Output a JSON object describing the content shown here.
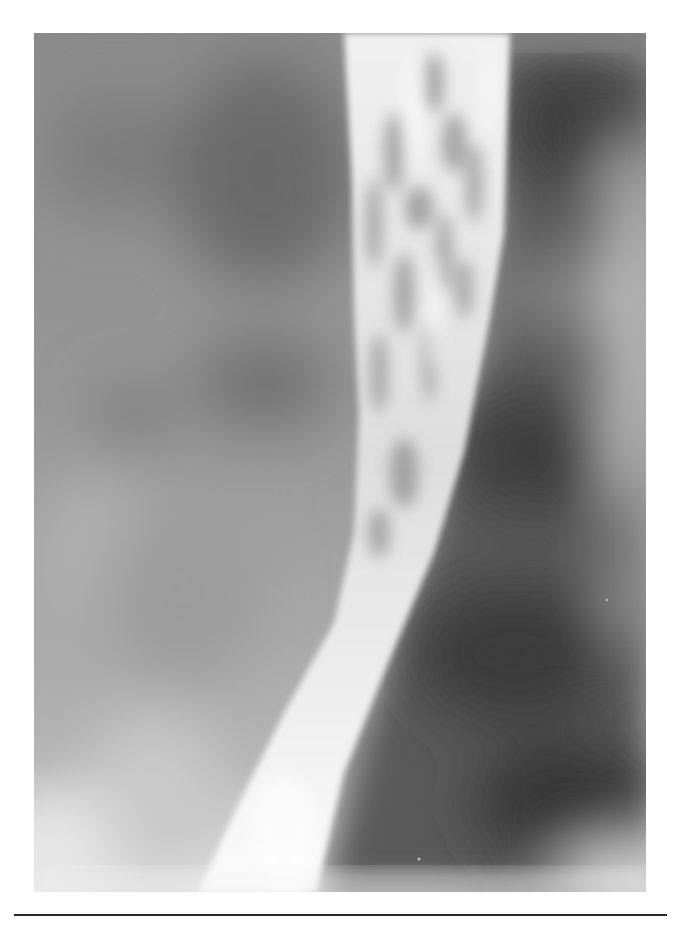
{
  "figure": {
    "type": "radiograph",
    "colors": {
      "background": "#ffffff",
      "soft_tissue": "#8e8e8e",
      "dark_lung": "#4a4a4a",
      "barium": "#f2f2f2",
      "rule": "#2a2a2a"
    }
  },
  "rule": {
    "present": true
  }
}
